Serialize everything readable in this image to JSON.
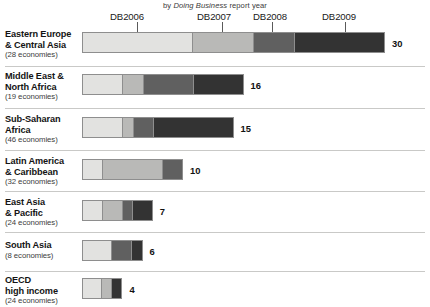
{
  "subtitle": {
    "pre": "by ",
    "emphasis": "Doing Business",
    "post": " report year"
  },
  "colors": {
    "DB2006": "#e2e2e0",
    "DB2007": "#b9b9b7",
    "DB2008": "#606060",
    "DB2009": "#333333",
    "bar_border": "#8e8e8e",
    "row_separator": "#c9c9c7",
    "leader_line": "#5a5a5a",
    "text": "#141414"
  },
  "chart_data": {
    "type": "bar",
    "orientation": "horizontal",
    "stacked": true,
    "title": "",
    "subtitle": "by Doing Business report year",
    "xlabel": "",
    "ylabel": "",
    "grid": false,
    "legend_position": "top",
    "axis_top_labels": [
      "DB2006",
      "DB2007",
      "DB2008",
      "DB2009"
    ],
    "series": [
      {
        "name": "DB2006",
        "values": [
          11,
          4,
          4,
          2,
          2,
          3,
          2
        ]
      },
      {
        "name": "DB2007",
        "values": [
          6,
          2,
          1,
          6,
          2,
          0,
          1
        ]
      },
      {
        "name": "DB2008",
        "values": [
          4,
          5,
          2,
          2,
          1,
          2,
          0
        ]
      },
      {
        "name": "DB2009",
        "values": [
          9,
          5,
          8,
          0,
          2,
          1,
          1
        ]
      }
    ],
    "categories": [
      "Eastern Europe & Central Asia",
      "Middle East & North Africa",
      "Sub-Saharan Africa",
      "Latin America & Caribbean",
      "East Asia & Pacific",
      "South Asia",
      "OECD high income"
    ],
    "totals": [
      30,
      16,
      15,
      10,
      7,
      6,
      4
    ]
  },
  "rows": [
    {
      "name_line1": "Eastern Europe",
      "name_line2": "& Central Asia",
      "economies": "(28 economies)",
      "total": "30",
      "segments": [
        11,
        6,
        4,
        9
      ]
    },
    {
      "name_line1": "Middle East &",
      "name_line2": "North Africa",
      "economies": "(19 economies)",
      "total": "16",
      "segments": [
        4,
        2,
        5,
        5
      ]
    },
    {
      "name_line1": "Sub-Saharan",
      "name_line2": "Africa",
      "economies": "(46 economies)",
      "total": "15",
      "segments": [
        4,
        1,
        2,
        8
      ]
    },
    {
      "name_line1": "Latin America",
      "name_line2": "& Caribbean",
      "economies": "(32 economies)",
      "total": "10",
      "segments": [
        2,
        6,
        2,
        0
      ]
    },
    {
      "name_line1": "East Asia",
      "name_line2": "& Pacific",
      "economies": "(24 economies)",
      "total": "7",
      "segments": [
        2,
        2,
        1,
        2
      ]
    },
    {
      "name_line1": "South Asia",
      "name_line2": "",
      "economies": "(8 economies)",
      "total": "6",
      "segments": [
        3,
        0,
        2,
        1
      ]
    },
    {
      "name_line1": "OECD",
      "name_line2": "high income",
      "economies": "(24 economies)",
      "total": "4",
      "segments": [
        2,
        1,
        0,
        1
      ]
    }
  ],
  "column_headers": [
    {
      "label": "DB2006",
      "label_x": 110,
      "leader_x": 137
    },
    {
      "label": "DB2007",
      "label_x": 197,
      "leader_x": 222
    },
    {
      "label": "DB2008",
      "label_x": 253,
      "leader_x": 272
    },
    {
      "label": "DB2009",
      "label_x": 322,
      "leader_x": 345
    }
  ]
}
